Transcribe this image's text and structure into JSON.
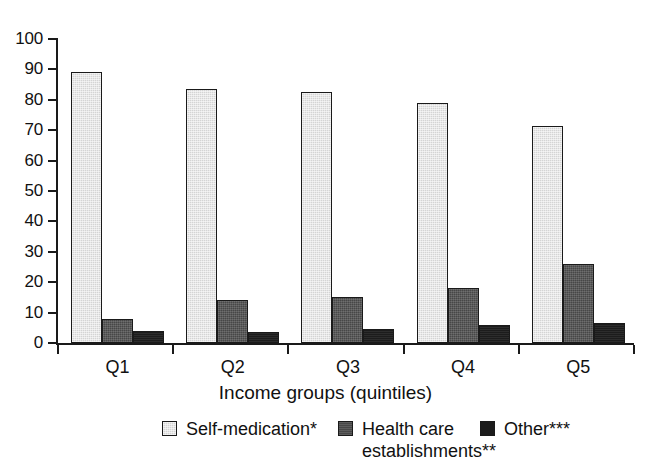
{
  "chart_data": {
    "type": "bar",
    "title": "",
    "subtitle": "",
    "xlabel": "Income groups (quintiles)",
    "ylabel": "",
    "categories": [
      "Q1",
      "Q2",
      "Q3",
      "Q4",
      "Q5"
    ],
    "series": [
      {
        "name": "Self-medication*",
        "color": "#d4d4d4",
        "values": [
          89,
          83.5,
          82.5,
          79,
          71.5
        ]
      },
      {
        "name": "Health care establishments**",
        "color": "#474747",
        "values": [
          8,
          14,
          15,
          18,
          26
        ]
      },
      {
        "name": "Other***",
        "color": "#1c1c1c",
        "values": [
          4,
          3.5,
          4.5,
          6,
          6.5
        ]
      }
    ],
    "ylim": [
      0,
      100
    ],
    "yticks": [
      0,
      10,
      20,
      30,
      40,
      50,
      60,
      70,
      80,
      90,
      100
    ],
    "ytick_labels": [
      "0",
      "10",
      "20",
      "30",
      "40",
      "50",
      "60",
      "70",
      "80",
      "90",
      "100"
    ],
    "grid": false,
    "legend_position": "bottom",
    "legend": [
      {
        "label": "Self-medication*",
        "color": "#d4d4d4"
      },
      {
        "label": "Health care\nestablishments**",
        "color": "#474747"
      },
      {
        "label": "Other***",
        "color": "#1c1c1c"
      }
    ]
  },
  "axes": {
    "x_title": "Income groups (quintiles)"
  }
}
